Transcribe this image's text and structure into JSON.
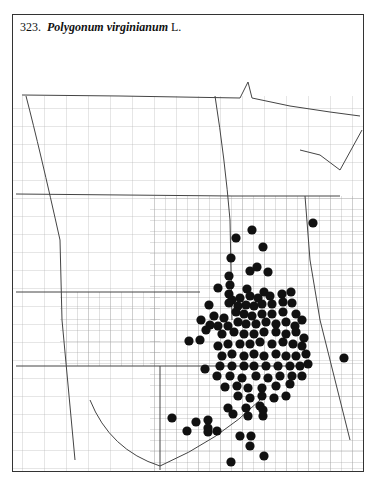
{
  "map": {
    "number": "323.",
    "species": "Polygonum virginianum",
    "author": "L.",
    "type": "county dot distribution map",
    "dot_color": "#111111",
    "line_color": "#555555",
    "dots": [
      [
        313,
        223
      ],
      [
        252,
        230
      ],
      [
        236,
        238
      ],
      [
        263,
        247
      ],
      [
        231,
        258
      ],
      [
        257,
        267
      ],
      [
        250,
        271
      ],
      [
        268,
        272
      ],
      [
        229,
        276
      ],
      [
        230,
        285
      ],
      [
        218,
        288
      ],
      [
        247,
        289
      ],
      [
        264,
        292
      ],
      [
        229,
        294
      ],
      [
        232,
        300
      ],
      [
        240,
        298
      ],
      [
        250,
        296
      ],
      [
        258,
        298
      ],
      [
        270,
        296
      ],
      [
        282,
        294
      ],
      [
        291,
        292
      ],
      [
        229,
        303
      ],
      [
        209,
        305
      ],
      [
        238,
        306
      ],
      [
        246,
        305
      ],
      [
        254,
        306
      ],
      [
        262,
        304
      ],
      [
        272,
        304
      ],
      [
        283,
        302
      ],
      [
        292,
        303
      ],
      [
        201,
        320
      ],
      [
        210,
        325
      ],
      [
        214,
        316
      ],
      [
        224,
        318
      ],
      [
        236,
        312
      ],
      [
        244,
        314
      ],
      [
        252,
        316
      ],
      [
        262,
        314
      ],
      [
        272,
        314
      ],
      [
        283,
        312
      ],
      [
        296,
        314
      ],
      [
        189,
        341
      ],
      [
        200,
        340
      ],
      [
        218,
        326
      ],
      [
        228,
        326
      ],
      [
        238,
        322
      ],
      [
        246,
        324
      ],
      [
        256,
        324
      ],
      [
        266,
        322
      ],
      [
        276,
        324
      ],
      [
        286,
        322
      ],
      [
        295,
        326
      ],
      [
        302,
        320
      ],
      [
        206,
        330
      ],
      [
        222,
        334
      ],
      [
        234,
        332
      ],
      [
        244,
        334
      ],
      [
        254,
        334
      ],
      [
        264,
        332
      ],
      [
        276,
        332
      ],
      [
        286,
        334
      ],
      [
        296,
        332
      ],
      [
        304,
        338
      ],
      [
        218,
        346
      ],
      [
        228,
        344
      ],
      [
        240,
        344
      ],
      [
        250,
        344
      ],
      [
        260,
        342
      ],
      [
        272,
        344
      ],
      [
        283,
        342
      ],
      [
        293,
        344
      ],
      [
        302,
        346
      ],
      [
        222,
        356
      ],
      [
        232,
        354
      ],
      [
        244,
        356
      ],
      [
        254,
        354
      ],
      [
        264,
        356
      ],
      [
        276,
        354
      ],
      [
        286,
        356
      ],
      [
        296,
        356
      ],
      [
        306,
        354
      ],
      [
        205,
        369
      ],
      [
        220,
        366
      ],
      [
        232,
        366
      ],
      [
        244,
        366
      ],
      [
        254,
        366
      ],
      [
        266,
        366
      ],
      [
        278,
        366
      ],
      [
        290,
        366
      ],
      [
        300,
        366
      ],
      [
        308,
        364
      ],
      [
        344,
        358
      ],
      [
        217,
        376
      ],
      [
        230,
        376
      ],
      [
        242,
        378
      ],
      [
        256,
        376
      ],
      [
        268,
        378
      ],
      [
        280,
        376
      ],
      [
        292,
        376
      ],
      [
        302,
        376
      ],
      [
        225,
        387
      ],
      [
        237,
        386
      ],
      [
        248,
        388
      ],
      [
        262,
        388
      ],
      [
        276,
        386
      ],
      [
        290,
        384
      ],
      [
        238,
        396
      ],
      [
        250,
        398
      ],
      [
        262,
        396
      ],
      [
        274,
        398
      ],
      [
        286,
        396
      ],
      [
        228,
        408
      ],
      [
        246,
        408
      ],
      [
        260,
        406
      ],
      [
        248,
        416
      ],
      [
        263,
        416
      ],
      [
        172,
        418
      ],
      [
        196,
        422
      ],
      [
        208,
        420
      ],
      [
        208,
        428
      ],
      [
        187,
        431
      ],
      [
        208,
        432
      ],
      [
        217,
        431
      ],
      [
        240,
        436
      ],
      [
        251,
        436
      ],
      [
        250,
        446
      ],
      [
        264,
        456
      ],
      [
        231,
        462
      ],
      [
        263,
        410
      ],
      [
        233,
        414
      ]
    ],
    "borders": {
      "state_lines": [
        "M22,95 L120,96 L240,98 L248,82 L252,98 L290,106 L330,112 L360,116",
        "M26,96 Q40,150 60,240 L62,320 L75,460",
        "M215,96 Q225,160 230,220 L232,320",
        "M16,194 L232,196",
        "M16,292 L200,292",
        "M16,366 L200,366 L300,366",
        "M160,366 L160,470",
        "M90,400 Q110,450 160,466 Q220,440 260,400",
        "M232,196 L310,196 L340,196",
        "M300,150 L320,155 L340,170 L362,130",
        "M305,196 L310,260 L320,320 L330,360 L350,440"
      ],
      "grid_spacing": 11
    }
  }
}
